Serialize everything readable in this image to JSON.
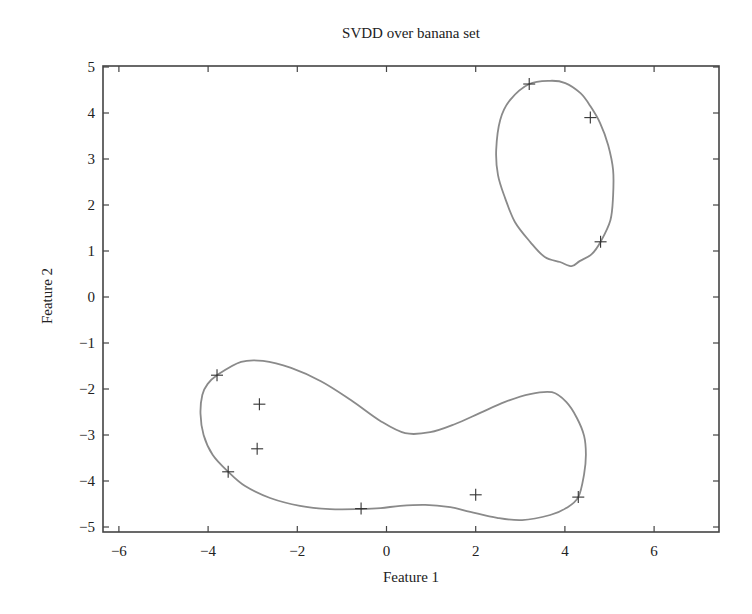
{
  "chart_data": {
    "type": "scatter",
    "title": "SVDD over banana set",
    "xlabel": "Feature 1",
    "ylabel": "Feature 2",
    "xlim": [
      -6.4,
      7.4
    ],
    "ylim": [
      -5.15,
      5.05
    ],
    "xticks": [
      -6,
      -4,
      -2,
      0,
      2,
      4,
      6
    ],
    "yticks": [
      -5,
      -4,
      -3,
      -2,
      -1,
      0,
      1,
      2,
      3,
      4,
      5
    ],
    "xtick_labels": [
      "−6",
      "−4",
      "−2",
      "0",
      "2",
      "4",
      "6"
    ],
    "ytick_labels": [
      "−5",
      "−4",
      "−3",
      "−2",
      "−1",
      "0",
      "1",
      "2",
      "3",
      "4",
      "5"
    ],
    "grid": false,
    "legend": null,
    "series": [
      {
        "name": "data points",
        "marker": "+",
        "x": [
          -3.8,
          -2.85,
          -2.9,
          -3.55,
          -0.57,
          2.0,
          4.3,
          3.2,
          4.57,
          4.8
        ],
        "y": [
          -1.7,
          -2.33,
          -3.3,
          -3.8,
          -4.6,
          -4.3,
          -4.35,
          4.63,
          3.9,
          1.2
        ]
      }
    ],
    "contours": [
      {
        "name": "SVDD boundary (lower cluster)",
        "points": [
          [
            -3.8,
            -1.7
          ],
          [
            -3.26,
            -1.41
          ],
          [
            -2.77,
            -1.39
          ],
          [
            -2.14,
            -1.54
          ],
          [
            -1.47,
            -1.83
          ],
          [
            -0.8,
            -2.24
          ],
          [
            -0.13,
            -2.7
          ],
          [
            0.42,
            -2.96
          ],
          [
            0.98,
            -2.94
          ],
          [
            1.54,
            -2.76
          ],
          [
            2.1,
            -2.52
          ],
          [
            2.66,
            -2.28
          ],
          [
            3.22,
            -2.11
          ],
          [
            3.71,
            -2.07
          ],
          [
            4.03,
            -2.28
          ],
          [
            4.27,
            -2.63
          ],
          [
            4.43,
            -3.02
          ],
          [
            4.47,
            -3.43
          ],
          [
            4.43,
            -3.85
          ],
          [
            4.3,
            -4.35
          ],
          [
            4.03,
            -4.59
          ],
          [
            3.67,
            -4.74
          ],
          [
            3.04,
            -4.85
          ],
          [
            2.48,
            -4.8
          ],
          [
            1.88,
            -4.67
          ],
          [
            1.43,
            -4.57
          ],
          [
            0.87,
            -4.52
          ],
          [
            0.31,
            -4.54
          ],
          [
            -0.13,
            -4.59
          ],
          [
            -0.57,
            -4.61
          ],
          [
            -1.27,
            -4.61
          ],
          [
            -1.94,
            -4.54
          ],
          [
            -2.61,
            -4.37
          ],
          [
            -3.17,
            -4.11
          ],
          [
            -3.55,
            -3.8
          ],
          [
            -3.9,
            -3.43
          ],
          [
            -4.1,
            -3.0
          ],
          [
            -4.17,
            -2.54
          ],
          [
            -4.13,
            -2.13
          ],
          [
            -4.01,
            -1.89
          ],
          [
            -3.8,
            -1.7
          ]
        ]
      },
      {
        "name": "SVDD boundary (upper cluster)",
        "points": [
          [
            3.2,
            4.63
          ],
          [
            3.67,
            4.7
          ],
          [
            4.01,
            4.65
          ],
          [
            4.35,
            4.43
          ],
          [
            4.57,
            4.15
          ],
          [
            4.79,
            3.78
          ],
          [
            4.97,
            3.3
          ],
          [
            5.08,
            2.76
          ],
          [
            5.08,
            2.2
          ],
          [
            5.02,
            1.67
          ],
          [
            4.8,
            1.2
          ],
          [
            4.6,
            0.93
          ],
          [
            4.33,
            0.78
          ],
          [
            4.15,
            0.67
          ],
          [
            3.89,
            0.76
          ],
          [
            3.55,
            0.87
          ],
          [
            3.22,
            1.2
          ],
          [
            2.88,
            1.63
          ],
          [
            2.66,
            2.15
          ],
          [
            2.5,
            2.65
          ],
          [
            2.46,
            3.2
          ],
          [
            2.55,
            3.85
          ],
          [
            2.77,
            4.28
          ],
          [
            3.2,
            4.63
          ]
        ]
      }
    ],
    "colors": {
      "contour": "#8a8a8a",
      "marker": "#333333",
      "axis": "#444444"
    }
  }
}
